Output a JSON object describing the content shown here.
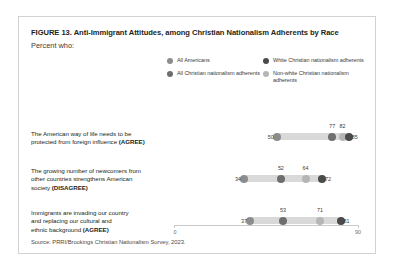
{
  "figure": {
    "title": "FIGURE 13. Anti-Immigrant Attitudes, among Christian Nationalism Adherents by Race",
    "subtitle": "Percent who:",
    "source": "Source: PRRI/Brookings Christian Nationalism Survey, 2023."
  },
  "colors": {
    "all_americans": "#8c8c8c",
    "all_cn_adherents": "#6e6e6e",
    "white_cn_adherents": "#4a4a4a",
    "nonwhite_cn_adherents": "#b5b5b5",
    "track": "#d9d9d9",
    "axis": "#c9c9c9",
    "text": "#231f20"
  },
  "legend": [
    {
      "label": "All Americans",
      "color": "#8c8c8c",
      "key": "all_americans"
    },
    {
      "label": "White Christian nationalism adherents",
      "color": "#4a4a4a",
      "key": "white_cn_adherents"
    },
    {
      "label": "All Christian nationalism adherents",
      "color": "#6e6e6e",
      "key": "all_cn_adherents"
    },
    {
      "label": "Non-white Christian nationalism adherents",
      "color": "#b5b5b5",
      "key": "nonwhite_cn_adherents"
    }
  ],
  "chart_data": {
    "type": "scatter",
    "title": "FIGURE 13. Anti-Immigrant Attitudes, among Christian Nationalism Adherents by Race",
    "subtitle": "Percent who:",
    "xlabel": "",
    "ylabel": "",
    "xlim": [
      0,
      90
    ],
    "xticks": [
      0,
      90
    ],
    "xtick_labels": [
      "0",
      "90"
    ],
    "grid": false,
    "legend_position": "top-right",
    "categories": [
      "The American way of life needs to be protected from foreign influence (AGREE)",
      "The growing number of newcomers from other countries strengthens American society (DISAGREE)",
      "Immigrants are invading our country and replacing our cultural and ethnic background (AGREE)"
    ],
    "series": [
      {
        "name": "All Americans",
        "color": "#8c8c8c",
        "values": [
          50,
          34,
          37
        ]
      },
      {
        "name": "All Christian nationalism adherents",
        "color": "#6e6e6e",
        "values": [
          77,
          52,
          53
        ]
      },
      {
        "name": "Non-white Christian nationalism adherents",
        "color": "#b5b5b5",
        "values": [
          82,
          64,
          71
        ]
      },
      {
        "name": "White Christian nationalism adherents",
        "color": "#4a4a4a",
        "values": [
          85,
          72,
          81
        ]
      }
    ]
  },
  "rows": [
    {
      "label_line1": "The American way of life needs to be",
      "label_line2": "protected from foreign influence ",
      "label_bold": "(AGREE)",
      "points": [
        {
          "series": "All Americans",
          "value": 50,
          "label": "50",
          "color": "#8c8c8c",
          "label_pos": "outside-left"
        },
        {
          "series": "All Christian nationalism adherents",
          "value": 77,
          "label": "77",
          "color": "#6e6e6e",
          "label_pos": "above"
        },
        {
          "series": "Non-white Christian nationalism adherents",
          "value": 82,
          "label": "82",
          "color": "#b5b5b5",
          "label_pos": "above"
        },
        {
          "series": "White Christian nationalism adherents",
          "value": 85,
          "label": "85",
          "color": "#4a4a4a",
          "label_pos": "outside-right"
        }
      ]
    },
    {
      "label_line1": "The growing number of newcomers from",
      "label_line2": "other countries strengthens American",
      "label_line3": "society ",
      "label_bold": "(DISAGREE)",
      "points": [
        {
          "series": "All Americans",
          "value": 34,
          "label": "34",
          "color": "#8c8c8c",
          "label_pos": "outside-left"
        },
        {
          "series": "All Christian nationalism adherents",
          "value": 52,
          "label": "52",
          "color": "#6e6e6e",
          "label_pos": "above"
        },
        {
          "series": "Non-white Christian nationalism adherents",
          "value": 64,
          "label": "64",
          "color": "#b5b5b5",
          "label_pos": "above"
        },
        {
          "series": "White Christian nationalism adherents",
          "value": 72,
          "label": "72",
          "color": "#4a4a4a",
          "label_pos": "outside-right"
        }
      ]
    },
    {
      "label_line1": "Immigrants are invading our country",
      "label_line2": "and replacing our cultural and",
      "label_line3": "ethnic background ",
      "label_bold": "(AGREE)",
      "points": [
        {
          "series": "All Americans",
          "value": 37,
          "label": "37",
          "color": "#8c8c8c",
          "label_pos": "outside-left"
        },
        {
          "series": "All Christian nationalism adherents",
          "value": 53,
          "label": "53",
          "color": "#6e6e6e",
          "label_pos": "above"
        },
        {
          "series": "Non-white Christian nationalism adherents",
          "value": 71,
          "label": "71",
          "color": "#b5b5b5",
          "label_pos": "above"
        },
        {
          "series": "White Christian nationalism adherents",
          "value": 81,
          "label": "81",
          "color": "#4a4a4a",
          "label_pos": "outside-right"
        }
      ]
    }
  ],
  "axis": {
    "min_label": "0",
    "max_label": "90"
  }
}
